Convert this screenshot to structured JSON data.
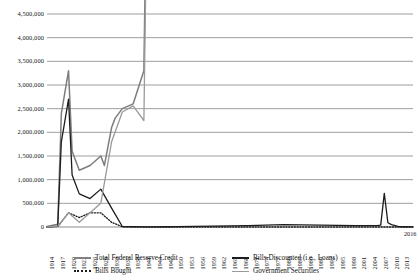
{
  "chart_data": {
    "type": "line",
    "title": "",
    "xlabel": "",
    "ylabel": "",
    "grid": true,
    "legend_position": "bottom",
    "xlim": [
      1914,
      2016
    ],
    "ylim": [
      0,
      4500000
    ],
    "y_ticks": [
      0,
      500000,
      1000000,
      1500000,
      2000000,
      2500000,
      3000000,
      3500000,
      4000000,
      4500000
    ],
    "y_tick_labels": [
      "0",
      "500,000",
      "1,000,000",
      "1,500,000",
      "2,000,000",
      "2,500,000",
      "3,000,000",
      "3,500,000",
      "4,000,000",
      "4,500,000"
    ],
    "x_ticks": [
      1914,
      1917,
      1920,
      1923,
      1926,
      1929,
      1932,
      1935,
      1938,
      1941,
      1944,
      1947,
      1950,
      1953,
      1956,
      1959,
      1962,
      1965,
      1968,
      1971,
      1974,
      1977,
      1980,
      1983,
      1986,
      1989,
      1992,
      1995,
      1998,
      2001,
      2004,
      2007,
      2010,
      2013,
      2016
    ],
    "x_tick_labels": [
      "1914",
      "1917",
      "1920",
      "1923",
      "1926",
      "1929",
      "1932",
      "1935",
      "1938",
      "1941",
      "1944",
      "1947",
      "1950",
      "1953",
      "1956",
      "1959",
      "1962",
      "1965",
      "1968",
      "1971",
      "1974",
      "1977",
      "1980",
      "1983",
      "1986",
      "1989",
      "1992",
      "1995",
      "1998",
      "2001",
      "2004",
      "2007",
      "2010",
      "2013",
      "2016"
    ],
    "series": [
      {
        "name": "Total Federal Reserve Credit",
        "color": "#7d7d7d",
        "style": "solid",
        "width": 1.5,
        "x": [
          1914,
          1917,
          1918,
          1920,
          1921,
          1923,
          1926,
          1929,
          1930,
          1932,
          1933,
          1935,
          1938,
          1941,
          1944,
          1945,
          1947,
          1950,
          1953,
          1956,
          1959,
          1962,
          1965,
          1968,
          1971,
          1974,
          1977,
          1980,
          1983,
          1986,
          1989,
          1992,
          1995,
          1998,
          2001,
          2004,
          2006,
          2007,
          2008,
          2009,
          2010,
          2011,
          2012,
          2013,
          2014,
          2015,
          2016
        ],
        "y": [
          10000,
          60000,
          2400000,
          3300000,
          1600000,
          1200000,
          1300000,
          1500000,
          1300000,
          2100000,
          2300000,
          2500000,
          2600000,
          3300000,
          19000000,
          24000000,
          23000000,
          22000000,
          26000000,
          27000000,
          29000000,
          32000000,
          40000000,
          50000000,
          70000000,
          90000000,
          120000000,
          140000000,
          170000000,
          220000000,
          260000000,
          310000000,
          400000000,
          480000000,
          600000000,
          730000000,
          840000000,
          890000000,
          2250000000,
          2240000000,
          2430000000,
          2930000000,
          2910000000,
          4030000000,
          4450000000,
          4490000000,
          4450000000
        ]
      },
      {
        "name": "Bills Discounted (i.e., Loans)",
        "color": "#1c1c1c",
        "style": "solid",
        "width": 1.3,
        "x": [
          1914,
          1917,
          1918,
          1920,
          1921,
          1923,
          1926,
          1929,
          1932,
          1935,
          1938,
          1941,
          1944,
          1947,
          1950,
          1960,
          1970,
          1980,
          1990,
          2000,
          2006,
          2007,
          2008,
          2009,
          2010,
          2012,
          2014,
          2016
        ],
        "y": [
          0,
          20000,
          1800000,
          2700000,
          1100000,
          700000,
          600000,
          800000,
          400000,
          10000,
          5000,
          3000,
          3000,
          5000,
          10000,
          20000,
          30000,
          50000,
          40000,
          30000,
          30000,
          40000,
          710000,
          90000,
          50000,
          10000,
          5000,
          3000
        ]
      },
      {
        "name": "Bills Bought",
        "color": "#1c1c1c",
        "style": "dotted",
        "width": 1.3,
        "x": [
          1914,
          1917,
          1920,
          1923,
          1926,
          1929,
          1932,
          1935,
          1938,
          1941,
          1944,
          1947,
          1950,
          1960,
          1970,
          1980,
          1990,
          2000,
          2010,
          2016
        ],
        "y": [
          0,
          10000,
          300000,
          200000,
          300000,
          300000,
          100000,
          5000,
          1000,
          500,
          200,
          100,
          50,
          20,
          10,
          5,
          2,
          1,
          0,
          0
        ]
      },
      {
        "name": "Government Securities",
        "color": "#9a9a9a",
        "style": "solid",
        "width": 1.3,
        "x": [
          1914,
          1917,
          1920,
          1923,
          1926,
          1929,
          1932,
          1935,
          1938,
          1941,
          1944,
          1945,
          1947,
          1950,
          1953,
          1956,
          1959,
          1962,
          1965,
          1968,
          1971,
          1974,
          1977,
          1980,
          1983,
          1986,
          1989,
          1992,
          1995,
          1998,
          2001,
          2004,
          2006,
          2007,
          2008,
          2009,
          2010,
          2011,
          2012,
          2013,
          2014,
          2015,
          2016
        ],
        "y": [
          0,
          20000,
          300000,
          100000,
          300000,
          500000,
          1800000,
          2430000,
          2560000,
          2250000,
          18800000,
          23700000,
          22500000,
          20700000,
          25200000,
          24800000,
          26600000,
          30800000,
          39100000,
          49100000,
          69900000,
          85000000,
          102000000,
          121000000,
          151000000,
          197000000,
          228000000,
          297000000,
          380000000,
          452000000,
          552000000,
          718000000,
          783000000,
          755000000,
          476000000,
          777000000,
          1020000000,
          1670000000,
          1660000000,
          2210000000,
          2460000000,
          2460000000,
          2460000000
        ]
      }
    ]
  },
  "legend": {
    "items": [
      {
        "label": "Total Federal Reserve Credit",
        "marker": "solid-thick"
      },
      {
        "label": "Bills Discounted (i.e., Loans)",
        "marker": "solid-dark"
      },
      {
        "label": "Bills Bought",
        "marker": "dotted"
      },
      {
        "label": "Government Securities",
        "marker": "solid-light"
      }
    ]
  },
  "style": {
    "gridline_color": "#8c8c8c",
    "axis_color": "#4d4d4d",
    "background": "#ffffff"
  }
}
